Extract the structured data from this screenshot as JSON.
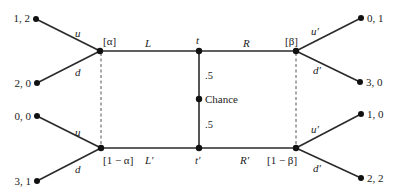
{
  "diagram": {
    "type": "extensive-form game tree (signaling game)",
    "chance_node": {
      "label": "Chance",
      "prob_up": ".5",
      "prob_down": ".5"
    },
    "sender_types": [
      {
        "name": "t",
        "label": "t"
      },
      {
        "name": "t_prime",
        "label": "t′"
      }
    ],
    "sender_actions": {
      "top_left": "L",
      "top_right": "R",
      "bottom_left": "L′",
      "bottom_right": "R′"
    },
    "receiver_beliefs": {
      "top_left": "[α]",
      "bottom_left": "[1 − α]",
      "top_right": "[β]",
      "bottom_right": "[1 − β]"
    },
    "receiver_actions": {
      "left_up": "u",
      "left_down": "d",
      "right_up": "u′",
      "right_down": "d′"
    },
    "payoffs": {
      "left_top_u": "1, 2",
      "left_top_d": "2, 0",
      "left_bottom_u": "0, 0",
      "left_bottom_d": "3, 1",
      "right_top_u": "0, 1",
      "right_top_d": "3, 0",
      "right_bottom_u": "1, 0",
      "right_bottom_d": "2, 2"
    }
  }
}
